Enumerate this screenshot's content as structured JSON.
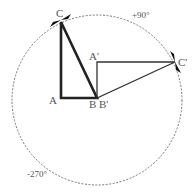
{
  "diagram": {
    "rotation_labels": {
      "positive": "+90°",
      "negative": "-270°"
    },
    "original_triangle": {
      "vertices": [
        "A",
        "B",
        "C"
      ],
      "labels": {
        "A": "A",
        "B": "B",
        "C": "C"
      }
    },
    "rotated_triangle": {
      "vertices": [
        "A'",
        "B'",
        "C'"
      ],
      "labels": {
        "A": "A'",
        "B": "B'",
        "C": "C'"
      }
    },
    "colors": {
      "original": "#222222",
      "rotated": "#333333",
      "circle": "#666666",
      "text": "#555555"
    }
  }
}
